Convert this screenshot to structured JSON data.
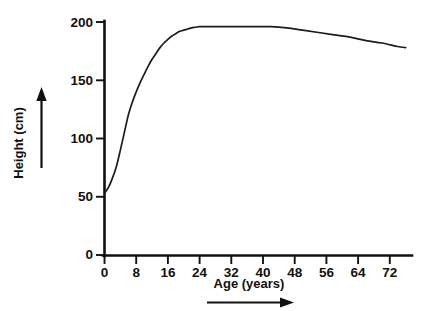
{
  "chart_data": {
    "type": "line",
    "title": "",
    "subtitle": "",
    "xlabel": "Age (years)",
    "ylabel": "Height (cm)",
    "xlim": [
      0,
      78
    ],
    "ylim": [
      0,
      200
    ],
    "grid": false,
    "legend": null,
    "x_ticks": [
      0,
      8,
      16,
      24,
      32,
      40,
      48,
      56,
      64,
      72
    ],
    "x_tick_labels": [
      "0",
      "8",
      "16",
      "24",
      "32",
      "40",
      "48",
      "56",
      "64",
      "72"
    ],
    "y_ticks": [
      0,
      50,
      100,
      150,
      200
    ],
    "y_tick_labels": [
      "0",
      "50",
      "100",
      "150",
      "200"
    ],
    "series": [
      {
        "name": "Height",
        "color": "#1c1c1c",
        "x": [
          0,
          1,
          2,
          3,
          4,
          5,
          6,
          7,
          8,
          9,
          10,
          11,
          12,
          13,
          14,
          15,
          16,
          17,
          18,
          19,
          20,
          21,
          22,
          23,
          24,
          26,
          30,
          34,
          38,
          42,
          46,
          50,
          54,
          58,
          62,
          66,
          70,
          74,
          76
        ],
        "y": [
          53,
          58,
          66,
          76,
          90,
          105,
          120,
          131,
          140,
          148,
          155,
          162,
          168,
          173,
          178,
          182,
          185,
          188,
          190,
          192,
          193,
          194,
          195,
          195.5,
          196,
          196,
          196,
          196,
          196,
          196,
          195,
          193,
          191,
          189,
          187,
          184,
          182,
          179,
          178
        ]
      }
    ],
    "annotations": [
      {
        "name": "y-axis-direction-arrow",
        "direction": "up",
        "meaning": "increasing height"
      },
      {
        "name": "x-axis-direction-arrow",
        "direction": "right",
        "meaning": "increasing age"
      }
    ]
  },
  "axes": {
    "y_title": "Height (cm)",
    "x_title": "Age (years)"
  },
  "colors": {
    "background": "#ffffff",
    "ink": "#111111",
    "curve": "#1c1c1c"
  }
}
